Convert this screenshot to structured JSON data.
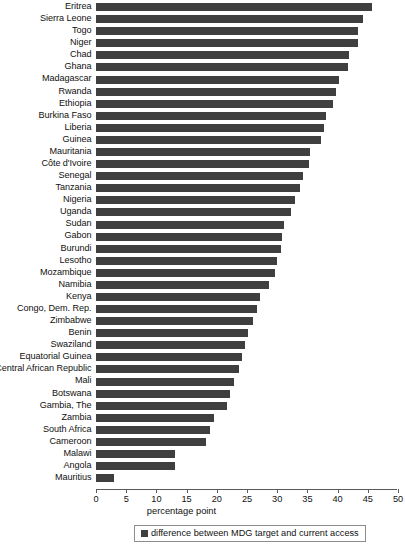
{
  "chart_data": {
    "type": "bar",
    "orientation": "horizontal",
    "title": "",
    "xlabel": "percentage point",
    "ylabel": "",
    "xlim": [
      0,
      50
    ],
    "xticks": [
      0,
      5,
      10,
      15,
      20,
      25,
      30,
      35,
      40,
      45,
      50
    ],
    "grid": false,
    "legend_position": "bottom",
    "series": [
      {
        "name": "difference between MDG target and current access",
        "color": "#3f3f3f",
        "values": [
          45.8,
          44.3,
          43.5,
          43.5,
          42.0,
          41.8,
          40.3,
          39.8,
          39.3,
          38.2,
          37.8,
          37.3,
          35.5,
          35.3,
          34.3,
          33.8,
          33.0,
          32.3,
          31.2,
          30.8,
          30.7,
          30.0,
          29.8,
          28.7,
          27.3,
          26.7,
          26.0,
          25.2,
          24.7,
          24.2,
          23.8,
          23.0,
          22.3,
          21.8,
          19.7,
          19.0,
          18.3,
          13.2,
          13.2,
          3.0
        ]
      }
    ],
    "categories": [
      "Eritrea",
      "Sierra Leone",
      "Togo",
      "Niger",
      "Chad",
      "Ghana",
      "Madagascar",
      "Rwanda",
      "Ethiopia",
      "Burkina Faso",
      "Liberia",
      "Guinea",
      "Mauritania",
      "Côte d'Ivoire",
      "Senegal",
      "Tanzania",
      "Nigeria",
      "Uganda",
      "Sudan",
      "Gabon",
      "Burundi",
      "Lesotho",
      "Mozambique",
      "Namibia",
      "Kenya",
      "Congo, Dem. Rep.",
      "Zimbabwe",
      "Benin",
      "Swaziland",
      "Equatorial Guinea",
      "Central African Republic",
      "Mali",
      "Botswana",
      "Gambia, The",
      "Zambia",
      "South Africa",
      "Cameroon",
      "Malawi",
      "Angola",
      "Mauritius"
    ]
  },
  "legend": {
    "entries": [
      {
        "label": "difference between MDG target and current access",
        "color": "#3f3f3f"
      }
    ]
  }
}
